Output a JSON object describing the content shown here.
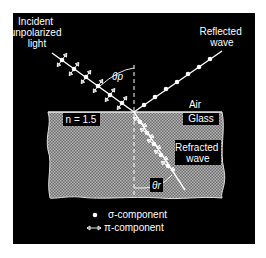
{
  "labels": {
    "incident_1": "Incident",
    "incident_2": "unpolarized",
    "incident_3": "light",
    "reflected_1": "Reflected",
    "reflected_2": "wave",
    "air": "Air",
    "glass": "Glass",
    "refracted_1": "Refracted",
    "refracted_2": "wave",
    "n_value": "n = 1.5",
    "theta_p": "θp",
    "theta_r": "θr"
  },
  "legend": {
    "sigma": "σ-component",
    "pi": "π-component"
  },
  "colors": {
    "background": "#000000",
    "foreground": "#ffffff",
    "glass": "#8a8a8a"
  }
}
